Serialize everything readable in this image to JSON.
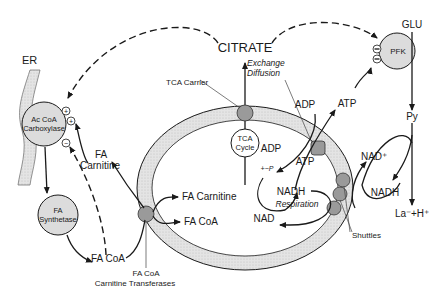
{
  "labels": {
    "er": "ER",
    "citrate": "CITRATE",
    "glu": "GLU",
    "pfk": "PFK",
    "tca_carrier": "TCA Carrier",
    "exchange": "Exchange",
    "diffusion": "Diffusion",
    "tca_cycle_1": "TCA",
    "tca_cycle_2": "Cycle",
    "adp_out": "ADP",
    "atp_out": "ATP",
    "adp_in": "ADP",
    "atp_in": "ATP",
    "pi": "+~P",
    "nadh_in": "NADH",
    "respiration": "Respiration",
    "nad_in": "NAD",
    "py": "Py",
    "nad_plus": "NAD⁺",
    "nadh_out": "NADH",
    "lactate": "La⁻+H⁺",
    "shuttles": "Shuttles",
    "accoa_1": "Ac CoA",
    "accoa_2": "Carboxylase",
    "fa_carnitine_out_1": "FA",
    "fa_carnitine_out_2": "Carnitine",
    "fa_synth_1": "FA",
    "fa_synth_2": "Synthetase",
    "fa_coa_out": "FA CoA",
    "fa_carnitine_in": "FA Carnitine",
    "fa_coa_in": "FA CoA",
    "transferase_1": "FA CoA",
    "transferase_2": "Carnitine Transferases",
    "plus": "+",
    "minus": "−"
  }
}
